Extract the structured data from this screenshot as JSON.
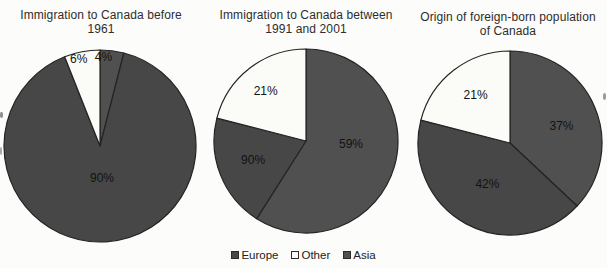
{
  "figure": {
    "background": "#fcfcfa",
    "colors": {
      "europe": "#474747",
      "asia": "#505050",
      "other": "#fbfbf8",
      "outline": "#242424",
      "label": "#121212",
      "title": "#2d2d2d"
    },
    "legend": {
      "items": [
        {
          "label": "Europe",
          "color_key": "europe"
        },
        {
          "label": "Other",
          "color_key": "other"
        },
        {
          "label": "Asia",
          "color_key": "asia"
        }
      ]
    },
    "charts": [
      {
        "title_lines": [
          "Immigration to Canada before",
          "1961"
        ],
        "slices": [
          {
            "name": "Asia",
            "value": 4,
            "label": "4%",
            "color_key": "asia",
            "label_r": 0.93,
            "label_da": -5
          },
          {
            "name": "Europe",
            "value": 90,
            "label": "90%",
            "color_key": "europe",
            "label_r": 0.33,
            "label_da": 0
          },
          {
            "name": "Other",
            "value": 6,
            "label": "6%",
            "color_key": "other",
            "label_r": 0.93,
            "label_da": -3
          }
        ]
      },
      {
        "title_lines": [
          "Immigration to Canada between",
          "1991 and 2001"
        ],
        "slices": [
          {
            "name": "Asia",
            "value": 59,
            "label": "59%",
            "color_key": "asia",
            "label_r": 0.49,
            "label_da": -13
          },
          {
            "name": "Europe",
            "value": 20,
            "label": "90%",
            "color_key": "europe",
            "label_r": 0.61,
            "label_da": 2
          },
          {
            "name": "Other",
            "value": 21,
            "label": "21%",
            "color_key": "other",
            "label_r": 0.7,
            "label_da": -1
          }
        ]
      },
      {
        "title_lines": [
          "Origin of foreign-born population",
          "of Canada"
        ],
        "slices": [
          {
            "name": "Asia",
            "value": 37,
            "label": "37%",
            "color_key": "asia",
            "label_r": 0.59,
            "label_da": 5
          },
          {
            "name": "Europe",
            "value": 42,
            "label": "42%",
            "color_key": "europe",
            "label_r": 0.51,
            "label_da": 0
          },
          {
            "name": "Other",
            "value": 21,
            "label": "21%",
            "color_key": "other",
            "label_r": 0.64,
            "label_da": 2
          }
        ]
      }
    ]
  },
  "chart_data": [
    {
      "type": "pie",
      "title": "Immigration to Canada before 1961",
      "categories": [
        "Asia",
        "Europe",
        "Other"
      ],
      "values": [
        4,
        90,
        6
      ],
      "labels_as_printed": [
        "4%",
        "90%",
        "6%"
      ],
      "start_angle_deg": 0,
      "direction": "clockwise",
      "legend": [
        "Europe",
        "Other",
        "Asia"
      ],
      "legend_position": "bottom-center"
    },
    {
      "type": "pie",
      "title": "Immigration to Canada between 1991 and 2001",
      "categories": [
        "Asia",
        "Europe",
        "Other"
      ],
      "values": [
        59,
        20,
        21
      ],
      "labels_as_printed": [
        "59%",
        "90%",
        "21%"
      ],
      "note": "the ~20% Europe slice is printed with the label 90% in the source scan",
      "start_angle_deg": 0,
      "direction": "clockwise",
      "legend": [
        "Europe",
        "Other",
        "Asia"
      ],
      "legend_position": "bottom-center"
    },
    {
      "type": "pie",
      "title": "Origin of foreign-born population of Canada",
      "categories": [
        "Asia",
        "Europe",
        "Other"
      ],
      "values": [
        37,
        42,
        21
      ],
      "labels_as_printed": [
        "37%",
        "42%",
        "21%"
      ],
      "start_angle_deg": 0,
      "direction": "clockwise",
      "legend": [
        "Europe",
        "Other",
        "Asia"
      ],
      "legend_position": "bottom-center"
    }
  ]
}
